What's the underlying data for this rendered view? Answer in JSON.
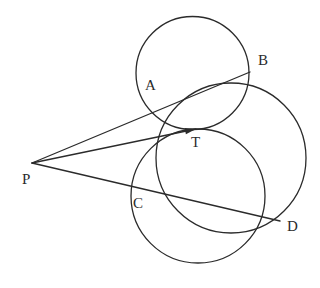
{
  "figure": {
    "stroke_color": "#2b2b2b",
    "label_color": "#2b2b2b",
    "background_color": "#ffffff",
    "stroke_width": 1.3
  },
  "points": {
    "P": {
      "label": "P",
      "x": 32,
      "y": 163,
      "label_x": 22,
      "label_y": 172
    },
    "A": {
      "label": "A",
      "x": 152,
      "y": 113,
      "label_x": 145,
      "label_y": 78
    },
    "B": {
      "label": "B",
      "x": 250,
      "y": 72,
      "label_x": 258,
      "label_y": 53
    },
    "C": {
      "label": "C",
      "x": 149,
      "y": 193,
      "label_x": 133,
      "label_y": 196
    },
    "D": {
      "label": "D",
      "x": 280,
      "y": 221,
      "label_x": 287,
      "label_y": 219
    },
    "T": {
      "label": "T",
      "x": 196,
      "y": 129,
      "label_x": 191,
      "label_y": 135
    }
  },
  "circles": [
    {
      "name": "upper-circle",
      "cx": 192.5,
      "cy": 73,
      "r": 56.5
    },
    {
      "name": "lower-circle",
      "cx": 198,
      "cy": 196,
      "r": 67
    },
    {
      "name": "large-right-circle",
      "cx": 231,
      "cy": 158,
      "r": 75
    }
  ],
  "rays": [
    {
      "name": "ray-p-a-b",
      "from": "P",
      "through": "A",
      "to": "B",
      "arrow": false
    },
    {
      "name": "ray-p-t",
      "from": "P",
      "to": "T",
      "arrow": true
    },
    {
      "name": "ray-p-c-d",
      "from": "P",
      "through": "C",
      "to": "D",
      "arrow": false
    }
  ]
}
